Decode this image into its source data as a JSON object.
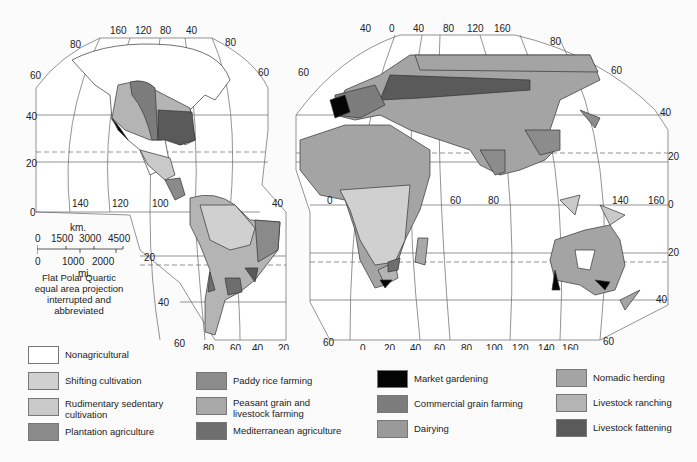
{
  "map": {
    "projection_caption": [
      "Flat Polar Quartic",
      "equal area projection",
      "interrupted and abbreviated"
    ],
    "scale": {
      "km_label": "km.",
      "km_ticks": [
        "0",
        "1500",
        "3000",
        "4500"
      ],
      "mi_ticks": [
        "0",
        "1000",
        "2000"
      ],
      "mi_label": "mi."
    },
    "americas": {
      "top_longitudes": [
        "160",
        "120",
        "80",
        "40"
      ],
      "corner_labels": [
        "80",
        "80",
        "60",
        "60"
      ],
      "left_latitudes": [
        "60",
        "40",
        "20",
        "0"
      ],
      "equator_longitudes": [
        "140",
        "120",
        "100"
      ],
      "equator_right": "40",
      "south_lat_labels": [
        "20",
        "40",
        "60"
      ],
      "bottom_longitudes": [
        "80",
        "60",
        "40",
        "20"
      ]
    },
    "eurasia": {
      "top_longitudes": [
        "40",
        "0",
        "40",
        "80",
        "120",
        "160"
      ],
      "corner_labels": [
        "60",
        "80",
        "60"
      ],
      "right_latitudes": [
        "40",
        "20",
        "0",
        "20",
        "40"
      ],
      "equator_longitudes": [
        "0",
        "60",
        "80",
        "140",
        "160"
      ],
      "bottom_left": "60",
      "bottom_longitudes": [
        "0",
        "20",
        "40",
        "60",
        "80",
        "100",
        "120",
        "140",
        "160"
      ],
      "bottom_right": "60"
    }
  },
  "legend": [
    {
      "label": "Nonagricultural",
      "color": "#ffffff"
    },
    {
      "label": "Shifting cultivation",
      "color": "#d0d0d0"
    },
    {
      "label": "Rudimentary sedentary cultivation",
      "color": "#c9c9c9"
    },
    {
      "label": "Plantation agriculture",
      "color": "#8a8a8a"
    },
    {
      "label": "Paddy rice farming",
      "color": "#8c8c8c"
    },
    {
      "label": "Peasant grain and livestock farming",
      "color": "#a8a8a8"
    },
    {
      "label": "Mediterranean agriculture",
      "color": "#6e6e6e"
    },
    {
      "label": "Market gardening",
      "color": "#050505"
    },
    {
      "label": "Commercial grain farming",
      "color": "#7c7c7c"
    },
    {
      "label": "Dairying",
      "color": "#9a9a9a"
    },
    {
      "label": "Nomadic herding",
      "color": "#a4a4a4"
    },
    {
      "label": "Livestock ranching",
      "color": "#b4b4b4"
    },
    {
      "label": "Livestock fattening",
      "color": "#5a5a5a"
    }
  ]
}
